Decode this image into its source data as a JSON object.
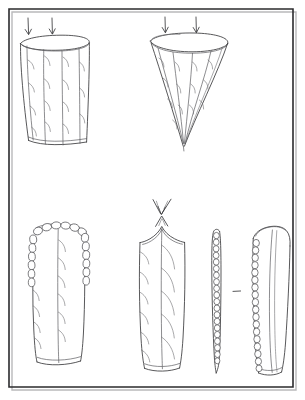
{
  "figure": {
    "title": "Hand-drawn line diagram plate",
    "medium": "pen-and-ink line drawing",
    "background_color": "#fdfdfc",
    "ink_color": "#3a3a3c",
    "frame_color": "#2b2b2d",
    "frame_shadow_color": "#b9b9bb",
    "panel_count": 5,
    "arrow_group_count": 3,
    "caption": "",
    "frame": {
      "x": 8,
      "y": 8,
      "width": 288,
      "height": 380,
      "label": "plate-border"
    },
    "panels": [
      {
        "id": "panel-top-left",
        "name": "tapered-cylinder-open-top",
        "shape": "cylinder",
        "description": "Open-topped tapering cylinder with elliptical rim, four longitudinal ridges and small curved barbs",
        "rim_type": "ellipse",
        "longitudinal_lines": 4,
        "barb_count": 14,
        "position": {
          "x": 22,
          "y": 35,
          "width": 80,
          "height": 120
        }
      },
      {
        "id": "panel-top-right",
        "name": "funnel-cone-open-top",
        "shape": "cone",
        "description": "Open-topped cone tapering to a sharp apex, elliptical rim, radiating ridges and curved barbs",
        "rim_type": "ellipse",
        "longitudinal_lines": 4,
        "barb_count": 14,
        "position": {
          "x": 150,
          "y": 33,
          "width": 92,
          "height": 113
        }
      },
      {
        "id": "panel-bottom-left",
        "name": "blade-rounded-tip-scalloped",
        "shape": "elongated-blade",
        "description": "Elongated blade with rounded scalloped crown, chains of bubble cells on both margins, median line and curved barbs",
        "tip_type": "rounded-scalloped",
        "median_line": true,
        "cell_chains": 2,
        "position": {
          "x": 30,
          "y": 222,
          "width": 58,
          "height": 145
        }
      },
      {
        "id": "panel-bottom-middle",
        "name": "blade-pointed-apex",
        "shape": "elongated-blade",
        "description": "Elongated blade with peaked pointed apex and concave shoulders, median line and long sweeping barbs",
        "tip_type": "pointed-apex",
        "median_line": true,
        "cell_chains": 0,
        "position": {
          "x": 138,
          "y": 222,
          "width": 50,
          "height": 150
        }
      },
      {
        "id": "panel-bottom-right-narrow",
        "name": "narrow-strip-cell-chain",
        "shape": "narrow-strip",
        "description": "Very narrow edge-on strip with a continuous chain of bubble cells running its full length, tapering to a point",
        "tip_type": "rounded",
        "median_line": false,
        "cell_chains": 1,
        "position": {
          "x": 210,
          "y": 225,
          "width": 13,
          "height": 148
        }
      },
      {
        "id": "panel-bottom-right-wide",
        "name": "blade-rounded-cell-margin",
        "shape": "elongated-blade",
        "description": "Broad rounded-top blade with a chain of bubble cells along the left margin and interior contour lines",
        "tip_type": "rounded",
        "median_line": true,
        "cell_chains": 1,
        "position": {
          "x": 248,
          "y": 224,
          "width": 42,
          "height": 152
        }
      }
    ],
    "arrow_groups": [
      {
        "id": "arrows-top-left",
        "name": "downward-arrow-pair-left",
        "direction": "down",
        "count": 2,
        "meaning": "applied force / flow into the cylinder",
        "position": {
          "x": 22,
          "y": 16
        }
      },
      {
        "id": "arrows-top-right",
        "name": "downward-arrow-pair-right",
        "direction": "down",
        "count": 2,
        "meaning": "applied force / flow into the cone",
        "position": {
          "x": 155,
          "y": 16
        }
      },
      {
        "id": "arrows-bottom-middle",
        "name": "converging-arrow-cluster",
        "direction": "converging-down",
        "count": 2,
        "meaning": "converging force onto the pointed apex",
        "position": {
          "x": 150,
          "y": 198
        }
      }
    ],
    "marks": [
      {
        "id": "dash-separator",
        "name": "dash-mark",
        "symbol": "–",
        "position": {
          "x": 236,
          "y": 291
        }
      }
    ]
  }
}
